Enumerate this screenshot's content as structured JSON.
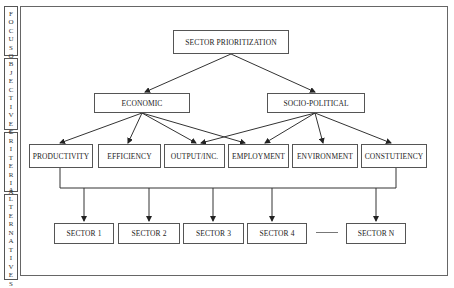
{
  "levels": [
    {
      "label": "FOCUS"
    },
    {
      "label": "OBJECTIVES"
    },
    {
      "label": "CRITERIA"
    },
    {
      "label": "ALTERNATIVES"
    }
  ],
  "focus": {
    "label": "SECTOR PRIORITIZATION"
  },
  "objectives": [
    {
      "label": "ECONOMIC"
    },
    {
      "label": "SOCIO-POLITICAL"
    }
  ],
  "criteria": [
    {
      "label": "PRODUCTIVITY"
    },
    {
      "label": "EFFICIENCY"
    },
    {
      "label": "OUTPUT/INC."
    },
    {
      "label": "EMPLOYMENT"
    },
    {
      "label": "ENVIRONMENT"
    },
    {
      "label": "CONSTUTIENCY"
    }
  ],
  "alternatives": [
    {
      "label": "SECTOR 1"
    },
    {
      "label": "SECTOR 2"
    },
    {
      "label": "SECTOR 3"
    },
    {
      "label": "SECTOR 4"
    },
    {
      "label": "SECTOR N"
    }
  ],
  "links": {
    "focus_to_objectives": [
      0,
      1
    ],
    "economic_to_criteria": [
      0,
      1,
      2,
      3
    ],
    "sociopolitical_to_criteria": [
      2,
      3,
      4,
      5
    ]
  },
  "ellipsis": "……"
}
